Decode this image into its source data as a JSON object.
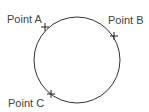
{
  "diagram": {
    "circle": {
      "cx": 77,
      "cy": 60,
      "r": 43,
      "stroke": "#333333"
    },
    "points": [
      {
        "label": "Point A",
        "x": 45,
        "y": 27,
        "label_x": 7,
        "label_y": 13
      },
      {
        "label": "Point B",
        "x": 114,
        "y": 36,
        "label_x": 108,
        "label_y": 14
      },
      {
        "label": "Point C",
        "x": 51,
        "y": 94,
        "label_x": 8,
        "label_y": 97
      }
    ]
  }
}
